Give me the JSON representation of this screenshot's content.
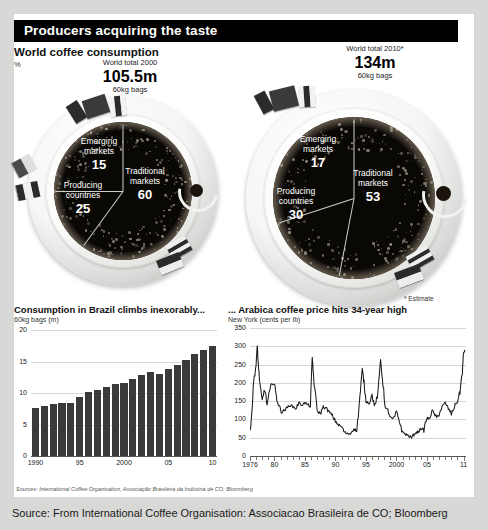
{
  "header": {
    "title": "Producers acquiring the taste"
  },
  "top": {
    "section_title": "World coffee consumption",
    "unit": "%",
    "estimate_note": "* Estimate"
  },
  "totals": [
    {
      "label": "World total 2000",
      "value": "105.5m",
      "unit": "60kg bags"
    },
    {
      "label": "World total 2010*",
      "value": "134m",
      "unit": "60kg bags"
    }
  ],
  "pies": [
    {
      "name": "world-2000",
      "year": "2000",
      "slices": [
        {
          "label_line1": "Traditional",
          "label_line2": "markets",
          "value": 60
        },
        {
          "label_line1": "Emerging",
          "label_line2": "markets",
          "value": 15
        },
        {
          "label_line1": "Producing",
          "label_line2": "countries",
          "value": 25
        }
      ]
    },
    {
      "name": "world-2010",
      "year": "2010",
      "slices": [
        {
          "label_line1": "Traditional",
          "label_line2": "markets",
          "value": 53
        },
        {
          "label_line1": "Emerging",
          "label_line2": "markets",
          "value": 17
        },
        {
          "label_line1": "Producing",
          "label_line2": "countries",
          "value": 30
        }
      ]
    }
  ],
  "bar_chart_heading": {
    "title": "Consumption in Brazil climbs inexorably...",
    "subtitle": "60kg bags (m)"
  },
  "line_chart_heading": {
    "title": "... Arabica coffee price hits 34-year high",
    "subtitle": "New York (cents per lb)"
  },
  "sources_line": "Sources: International Coffee Organisation, Associação Brasileira da Indústria de CO; Bloomberg",
  "caption": "Source: From International Coffee Organisation: Associacao Brasileira de CO; Bloomberg",
  "chart_data": [
    {
      "type": "pie",
      "title": "World coffee consumption 2000",
      "subtitle": "World total 2000 — 105.5m 60kg bags",
      "unit": "%",
      "categories": [
        "Traditional markets",
        "Emerging markets",
        "Producing countries"
      ],
      "values": [
        60,
        15,
        25
      ],
      "legend": "inside-slices"
    },
    {
      "type": "pie",
      "title": "World coffee consumption 2010*",
      "subtitle": "World total 2010* — 134m 60kg bags",
      "unit": "%",
      "categories": [
        "Traditional markets",
        "Emerging markets",
        "Producing countries"
      ],
      "values": [
        53,
        17,
        30
      ],
      "legend": "inside-slices"
    },
    {
      "type": "bar",
      "title": "Consumption in Brazil climbs inexorably...",
      "ylabel": "60kg bags (m)",
      "xlabel": "",
      "ylim": [
        0,
        20
      ],
      "yticks": [
        0,
        5,
        10,
        15,
        20
      ],
      "xticks": [
        "1990",
        "95",
        "2000",
        "05",
        "10"
      ],
      "grid": true,
      "categories": [
        "1990",
        "1991",
        "1992",
        "1993",
        "1994",
        "1995",
        "1996",
        "1997",
        "1998",
        "1999",
        "2000",
        "2001",
        "2002",
        "2003",
        "2004",
        "2005",
        "2006",
        "2007",
        "2008",
        "2009",
        "2010"
      ],
      "values": [
        7.6,
        7.9,
        8.3,
        8.4,
        8.4,
        9.3,
        10.1,
        10.5,
        11.0,
        11.4,
        11.6,
        12.2,
        12.9,
        13.3,
        13.0,
        13.8,
        14.4,
        15.2,
        16.2,
        16.9,
        17.5
      ]
    },
    {
      "type": "line",
      "title": "... Arabica coffee price hits 34-year high",
      "ylabel": "New York (cents per lb)",
      "xlabel": "",
      "ylim": [
        0,
        350
      ],
      "yticks": [
        0,
        50,
        100,
        150,
        200,
        250,
        300,
        350
      ],
      "xticks": [
        "1976",
        "80",
        "85",
        "90",
        "95",
        "2000",
        "05",
        "11"
      ],
      "grid": true,
      "x": [
        1976.0,
        1976.3,
        1976.6,
        1977.0,
        1977.2,
        1977.4,
        1977.7,
        1978.0,
        1978.4,
        1978.8,
        1979.2,
        1979.6,
        1980.0,
        1980.4,
        1980.8,
        1981.2,
        1981.6,
        1982.0,
        1982.5,
        1983.0,
        1983.5,
        1984.0,
        1984.5,
        1985.0,
        1985.5,
        1985.9,
        1986.2,
        1986.5,
        1987.0,
        1987.5,
        1988.0,
        1988.5,
        1989.0,
        1989.5,
        1990.0,
        1990.5,
        1991.0,
        1991.5,
        1992.0,
        1992.5,
        1993.0,
        1993.5,
        1994.0,
        1994.4,
        1994.7,
        1995.0,
        1995.5,
        1996.0,
        1996.5,
        1997.0,
        1997.4,
        1997.8,
        1998.2,
        1998.6,
        1999.0,
        1999.5,
        2000.0,
        2000.5,
        2001.0,
        2001.5,
        2002.0,
        2002.5,
        2003.0,
        2003.5,
        2004.0,
        2004.5,
        2005.0,
        2005.4,
        2005.8,
        2006.2,
        2006.6,
        2007.0,
        2007.5,
        2008.0,
        2008.5,
        2009.0,
        2009.5,
        2010.0,
        2010.4,
        2010.8,
        2011.0,
        2011.2
      ],
      "y": [
        70,
        118,
        205,
        250,
        300,
        240,
        185,
        150,
        185,
        140,
        175,
        200,
        195,
        155,
        135,
        120,
        125,
        130,
        140,
        135,
        130,
        145,
        140,
        145,
        140,
        135,
        270,
        200,
        125,
        115,
        135,
        130,
        120,
        110,
        95,
        85,
        80,
        65,
        60,
        62,
        75,
        68,
        160,
        235,
        200,
        150,
        145,
        165,
        135,
        175,
        265,
        195,
        130,
        125,
        105,
        100,
        120,
        95,
        65,
        60,
        55,
        50,
        62,
        65,
        75,
        72,
        105,
        100,
        125,
        115,
        105,
        115,
        135,
        145,
        130,
        115,
        135,
        150,
        175,
        230,
        280,
        290
      ]
    }
  ]
}
